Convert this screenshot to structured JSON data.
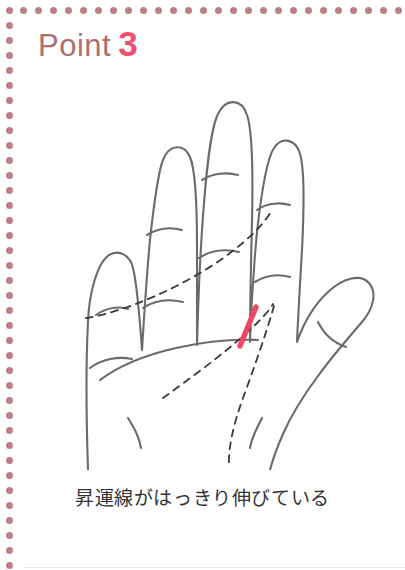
{
  "page": {
    "width": 405,
    "height": 570,
    "background_color": "#ffffff"
  },
  "border": {
    "style": "dotted",
    "dot_color": "#bb8086",
    "dot_diameter_px": 7,
    "dot_spacing_px": 15,
    "sides": [
      "top",
      "left"
    ]
  },
  "header": {
    "label": "Point",
    "number": "3",
    "label_color": "#ab6f6d",
    "number_color": "#ef4f6d"
  },
  "illustration": {
    "name": "open-right-palm-line-drawing",
    "outline_color": "#6b6b6b",
    "crease_color": "#6b6b6b",
    "palm_line_style": "dashed",
    "palm_line_color": "#3a3a3a",
    "highlight_color": "#ef4668",
    "highlight_name": "rising-fortune-line",
    "parts": [
      "pinky-finger",
      "ring-finger",
      "middle-finger",
      "index-finger",
      "thumb",
      "palm",
      "wrist"
    ],
    "palm_lines": [
      "heart-line",
      "head-line",
      "life-line"
    ]
  },
  "caption": {
    "text": "昇運線がはっきり伸びている",
    "color": "#333333"
  }
}
